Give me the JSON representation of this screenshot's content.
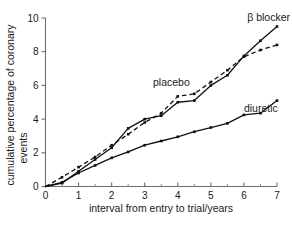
{
  "chart_data": {
    "type": "line",
    "title": "",
    "xlabel": "interval from entry to trial/years",
    "ylabel": "cumulative percentage of coronary events",
    "xlim": [
      0,
      7
    ],
    "ylim": [
      0,
      10
    ],
    "xticks": [
      0,
      1,
      2,
      3,
      4,
      5,
      6,
      7
    ],
    "xticklabels": [
      "0",
      "1",
      "2",
      "3",
      "4",
      "5",
      "6",
      "7"
    ],
    "yticks": [
      0,
      2,
      4,
      6,
      8,
      10
    ],
    "yticklabels": [
      "0",
      "2",
      "4",
      "6",
      "8",
      "10"
    ],
    "xminor_ticks": [
      0.5,
      1.5,
      2.5,
      3.5,
      4.5,
      5.5,
      6.5
    ],
    "grid": false,
    "legend_position": "inline-annotations",
    "x": [
      0,
      0.5,
      1,
      1.5,
      2,
      2.5,
      3,
      3.5,
      4,
      4.5,
      5,
      5.5,
      6,
      6.5,
      7
    ],
    "series": [
      {
        "name": "β blocker",
        "label": "β blocker",
        "linestyle": "solid",
        "marker": "filled-square",
        "color": "#111111",
        "values": [
          0,
          0.2,
          0.9,
          1.6,
          2.3,
          3.45,
          4.0,
          4.2,
          5.0,
          5.1,
          6.0,
          6.6,
          7.75,
          8.65,
          9.5
        ]
      },
      {
        "name": "placebo",
        "label": "placebo",
        "linestyle": "dashed",
        "marker": "filled-square",
        "color": "#111111",
        "values": [
          0,
          0.55,
          1.15,
          1.75,
          2.45,
          3.1,
          3.8,
          4.35,
          5.35,
          5.5,
          6.2,
          6.9,
          7.7,
          8.1,
          8.4
        ]
      },
      {
        "name": "diuretic",
        "label": "diuretic",
        "linestyle": "solid",
        "marker": "filled-square",
        "color": "#111111",
        "values": [
          0,
          0.25,
          0.8,
          1.25,
          1.7,
          2.05,
          2.45,
          2.7,
          2.95,
          3.25,
          3.5,
          3.75,
          4.25,
          4.35,
          5.1
        ]
      }
    ],
    "annotations": [
      {
        "text": "β blocker",
        "x": 6.1,
        "y": 9.85
      },
      {
        "text": "placebo",
        "x": 3.25,
        "y": 5.95
      },
      {
        "text": "diuretic",
        "x": 6.0,
        "y": 4.45
      }
    ]
  }
}
